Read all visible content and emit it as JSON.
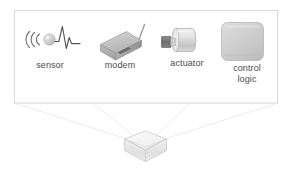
{
  "diagram": {
    "panel": {
      "name": "component-panel",
      "border_color": "#d8d8d8",
      "fill": "#ffffff"
    },
    "projection": {
      "name": "projection-lines",
      "line_color": "#e2e2e2",
      "description": "perspective lines from panel corners converging to the device"
    },
    "components": [
      {
        "id": "sensor",
        "label": "sensor",
        "icon": "sensor-waveform-icon",
        "color": "#9a9a9a"
      },
      {
        "id": "modem",
        "label": "modem",
        "icon": "modem-box-icon",
        "color": "#b5b5b5"
      },
      {
        "id": "actuator",
        "label": "actuator",
        "icon": "actuator-cylinder-icon",
        "color": "#cfcfcf",
        "accent": "#6e6e6e"
      },
      {
        "id": "control-logic",
        "label": "control\nlogic",
        "icon": "control-logic-block-icon",
        "color": "#cdcdcd"
      }
    ],
    "device": {
      "name": "target-device",
      "label": "",
      "color": "#e8e8e8",
      "outline": "#c9c9c9"
    }
  }
}
